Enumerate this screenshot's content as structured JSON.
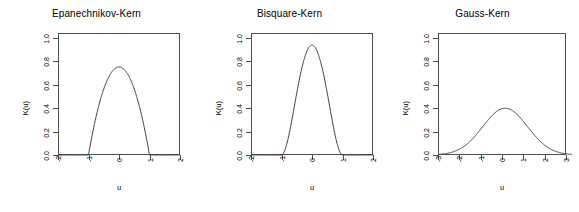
{
  "figure": {
    "background_color": "#ffffff",
    "axis_color": "#4d4d4d",
    "curve_color": "#3a3a3a"
  },
  "panels": [
    {
      "id": "epanechnikov",
      "title": "Epanechnikov-Kern",
      "xlabel": "u",
      "ylabel": "K(u)",
      "xticks": [
        "-2",
        "-1",
        "0",
        "1",
        "2"
      ],
      "yticks": [
        "0.0",
        "0.2",
        "0.4",
        "0.6",
        "0.8",
        "1.0"
      ]
    },
    {
      "id": "bisquare",
      "title": "Bisquare-Kern",
      "xlabel": "u",
      "ylabel": "K(u)",
      "xticks": [
        "-2",
        "-1",
        "0",
        "1",
        "2"
      ],
      "yticks": [
        "0.0",
        "0.2",
        "0.4",
        "0.6",
        "0.8",
        "1.0"
      ]
    },
    {
      "id": "gauss",
      "title": "Gauss-Kern",
      "xlabel": "u",
      "ylabel": "K(u)",
      "xticks": [
        "-3",
        "-2",
        "-1",
        "0",
        "1",
        "2",
        "3"
      ],
      "yticks": [
        "0.0",
        "0.2",
        "0.4",
        "0.6",
        "0.8",
        "1.0"
      ]
    }
  ],
  "chart_data": [
    {
      "type": "line",
      "title": "Epanechnikov-Kern",
      "xlabel": "u",
      "ylabel": "K(u)",
      "xlim": [
        -2,
        2
      ],
      "ylim": [
        0,
        1.04
      ],
      "xticks": [
        -2,
        -1,
        0,
        1,
        2
      ],
      "yticks": [
        0.0,
        0.2,
        0.4,
        0.6,
        0.8,
        1.0
      ],
      "grid": false,
      "legend": null,
      "peak_value": 0.75,
      "support": [
        -1,
        1
      ],
      "formula": "K(u) = 0.75 * (1 - u^2) for |u| <= 1, else 0",
      "x": [
        -2.0,
        -1.8,
        -1.6,
        -1.4,
        -1.2,
        -1.0,
        -0.9,
        -0.8,
        -0.7,
        -0.6,
        -0.5,
        -0.4,
        -0.3,
        -0.2,
        -0.1,
        0.0,
        0.1,
        0.2,
        0.3,
        0.4,
        0.5,
        0.6,
        0.7,
        0.8,
        0.9,
        1.0,
        1.2,
        1.4,
        1.6,
        1.8,
        2.0
      ],
      "y": [
        0.0,
        0.0,
        0.0,
        0.0,
        0.0,
        0.0,
        0.1425,
        0.27,
        0.3825,
        0.48,
        0.5625,
        0.63,
        0.6825,
        0.72,
        0.7425,
        0.75,
        0.7425,
        0.72,
        0.6825,
        0.63,
        0.5625,
        0.48,
        0.3825,
        0.27,
        0.1425,
        0.0,
        0.0,
        0.0,
        0.0,
        0.0,
        0.0
      ]
    },
    {
      "type": "line",
      "title": "Bisquare-Kern",
      "xlabel": "u",
      "ylabel": "K(u)",
      "xlim": [
        -2,
        2
      ],
      "ylim": [
        0,
        1.04
      ],
      "xticks": [
        -2,
        -1,
        0,
        1,
        2
      ],
      "yticks": [
        0.0,
        0.2,
        0.4,
        0.6,
        0.8,
        1.0
      ],
      "grid": false,
      "legend": null,
      "peak_value": 0.9375,
      "support": [
        -1,
        1
      ],
      "formula": "K(u) = 0.9375 * (1 - u^2)^2 for |u| <= 1, else 0",
      "x": [
        -2.0,
        -1.8,
        -1.6,
        -1.4,
        -1.2,
        -1.0,
        -0.9,
        -0.8,
        -0.7,
        -0.6,
        -0.5,
        -0.4,
        -0.3,
        -0.2,
        -0.1,
        0.0,
        0.1,
        0.2,
        0.3,
        0.4,
        0.5,
        0.6,
        0.7,
        0.8,
        0.9,
        1.0,
        1.2,
        1.4,
        1.6,
        1.8,
        2.0
      ],
      "y": [
        0.0,
        0.0,
        0.0,
        0.0,
        0.0,
        0.0,
        0.0271,
        0.0972,
        0.1913,
        0.3072,
        0.4219,
        0.5513,
        0.6635,
        0.7614,
        0.9188,
        0.9375,
        0.9188,
        0.7614,
        0.6635,
        0.5513,
        0.4219,
        0.3072,
        0.1913,
        0.0972,
        0.0271,
        0.0,
        0.0,
        0.0,
        0.0,
        0.0,
        0.0
      ]
    },
    {
      "type": "line",
      "title": "Gauss-Kern",
      "xlabel": "u",
      "ylabel": "K(u)",
      "xlim": [
        -3,
        3
      ],
      "ylim": [
        0,
        1.04
      ],
      "xticks": [
        -3,
        -2,
        -1,
        0,
        1,
        2,
        3
      ],
      "yticks": [
        0.0,
        0.2,
        0.4,
        0.6,
        0.8,
        1.0
      ],
      "grid": false,
      "legend": null,
      "peak_value": 0.3989,
      "support": [
        -3,
        3
      ],
      "formula": "K(u) = (1/sqrt(2*pi)) * exp(-u^2/2)",
      "x": [
        -3.0,
        -2.75,
        -2.5,
        -2.25,
        -2.0,
        -1.75,
        -1.5,
        -1.25,
        -1.0,
        -0.75,
        -0.5,
        -0.25,
        0.0,
        0.25,
        0.5,
        0.75,
        1.0,
        1.25,
        1.5,
        1.75,
        2.0,
        2.25,
        2.5,
        2.75,
        3.0
      ],
      "y": [
        0.0044,
        0.0091,
        0.0175,
        0.0317,
        0.054,
        0.0863,
        0.1295,
        0.1826,
        0.242,
        0.3011,
        0.3521,
        0.3867,
        0.3989,
        0.3867,
        0.3521,
        0.3011,
        0.242,
        0.1826,
        0.1295,
        0.0863,
        0.054,
        0.0317,
        0.0175,
        0.0091,
        0.0044
      ]
    }
  ]
}
